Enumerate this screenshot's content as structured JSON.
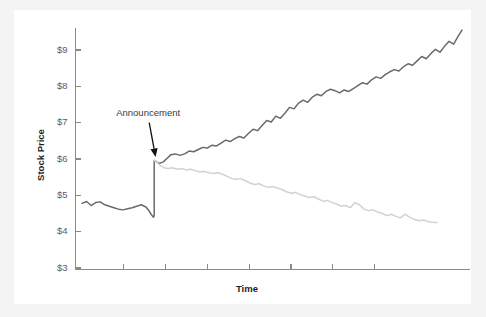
{
  "figure": {
    "background_color": "#f4f4f4",
    "panel_color": "#ffffff"
  },
  "chart_data": {
    "type": "line",
    "title": "",
    "subtitle": "",
    "xlabel": "Time",
    "ylabel": "Stock Price",
    "xlim": [
      0,
      100
    ],
    "ylim": [
      3,
      9.7
    ],
    "grid": false,
    "legend_position": "none",
    "y_tick_labels": [
      "$9",
      "$8",
      "$7",
      "$6",
      "$5",
      "$4",
      "$3"
    ],
    "y_tick_values": [
      9,
      8,
      7,
      6,
      5,
      4,
      3
    ],
    "x_tick_labels": [],
    "x_tick_values": [
      11,
      22,
      33,
      44,
      55,
      66,
      77
    ],
    "annotations": [
      {
        "text": "Announcement",
        "label_x": 9,
        "label_y": 7.25,
        "point_x": 19.5,
        "point_y": 6.0
      }
    ],
    "series": [
      {
        "name": "post-announcement-upward",
        "color": "#6a6a6a",
        "width": 1.5,
        "x": [
          0.0,
          1.2,
          2.4,
          3.6,
          4.8,
          6.0,
          7.2,
          8.4,
          9.6,
          10.8,
          12.0,
          13.2,
          14.4,
          15.6,
          16.8,
          17.6,
          18.2,
          18.6,
          18.8,
          19.0,
          19.0,
          19.6,
          20.4,
          21.4,
          22.4,
          23.4,
          24.6,
          25.8,
          27.0,
          28.2,
          29.4,
          30.6,
          31.8,
          33.0,
          34.2,
          35.4,
          36.6,
          37.8,
          39.0,
          40.2,
          41.4,
          42.6,
          43.8,
          45.0,
          46.2,
          47.4,
          48.6,
          49.8,
          51.0,
          52.2,
          53.4,
          54.6,
          55.8,
          57.0,
          58.2,
          59.4,
          60.6,
          61.8,
          63.0,
          64.2,
          65.4,
          66.6,
          67.8,
          69.0,
          70.2,
          71.4,
          72.6,
          73.8,
          75.0,
          76.2,
          77.4,
          78.6,
          79.8,
          81.0,
          82.2,
          83.4,
          84.6,
          85.8,
          87.0,
          88.2,
          89.4,
          90.6,
          91.8,
          93.0,
          94.2,
          95.4,
          96.6,
          97.8,
          99.0,
          100.0
        ],
        "y": [
          4.78,
          4.83,
          4.72,
          4.8,
          4.82,
          4.74,
          4.7,
          4.66,
          4.62,
          4.6,
          4.63,
          4.66,
          4.7,
          4.74,
          4.68,
          4.58,
          4.48,
          4.42,
          4.4,
          4.44,
          5.96,
          5.92,
          5.88,
          5.92,
          6.02,
          6.12,
          6.14,
          6.1,
          6.14,
          6.22,
          6.2,
          6.26,
          6.32,
          6.3,
          6.38,
          6.36,
          6.44,
          6.52,
          6.48,
          6.56,
          6.62,
          6.58,
          6.7,
          6.82,
          6.78,
          6.92,
          7.06,
          7.02,
          7.18,
          7.12,
          7.26,
          7.42,
          7.38,
          7.54,
          7.62,
          7.56,
          7.7,
          7.78,
          7.74,
          7.86,
          7.92,
          7.88,
          7.82,
          7.9,
          7.86,
          7.94,
          8.02,
          8.1,
          8.06,
          8.18,
          8.26,
          8.22,
          8.32,
          8.4,
          8.46,
          8.42,
          8.54,
          8.62,
          8.58,
          8.7,
          8.82,
          8.76,
          8.9,
          9.02,
          8.94,
          9.1,
          9.24,
          9.16,
          9.38,
          9.55
        ]
      },
      {
        "name": "counterfactual-downward",
        "color": "#d2d2d2",
        "width": 1.5,
        "x": [
          19.0,
          19.8,
          20.6,
          21.6,
          22.6,
          23.8,
          25.0,
          26.2,
          27.4,
          28.6,
          29.8,
          31.0,
          32.2,
          33.4,
          34.6,
          35.8,
          37.0,
          38.2,
          39.4,
          40.6,
          41.8,
          43.0,
          44.2,
          45.4,
          46.6,
          47.8,
          49.0,
          50.2,
          51.4,
          52.6,
          53.8,
          55.0,
          56.2,
          57.4,
          58.6,
          59.8,
          61.0,
          62.2,
          63.4,
          64.6,
          65.8,
          67.0,
          68.2,
          69.4,
          70.6,
          71.8,
          73.0,
          74.2,
          75.4,
          76.6,
          77.8,
          79.0,
          80.2,
          81.4,
          82.6,
          83.8,
          85.0,
          86.2,
          87.4,
          88.6,
          89.8,
          91.0,
          92.2,
          93.4
        ],
        "y": [
          5.96,
          5.9,
          5.82,
          5.76,
          5.74,
          5.76,
          5.72,
          5.74,
          5.7,
          5.72,
          5.68,
          5.64,
          5.66,
          5.62,
          5.6,
          5.62,
          5.58,
          5.52,
          5.46,
          5.44,
          5.46,
          5.4,
          5.34,
          5.3,
          5.32,
          5.26,
          5.22,
          5.24,
          5.2,
          5.16,
          5.1,
          5.06,
          5.08,
          5.02,
          4.98,
          4.94,
          4.96,
          4.9,
          4.84,
          4.86,
          4.8,
          4.76,
          4.7,
          4.72,
          4.66,
          4.8,
          4.74,
          4.62,
          4.58,
          4.6,
          4.54,
          4.5,
          4.44,
          4.48,
          4.42,
          4.38,
          4.48,
          4.4,
          4.34,
          4.3,
          4.32,
          4.28,
          4.26,
          4.25
        ]
      }
    ]
  }
}
